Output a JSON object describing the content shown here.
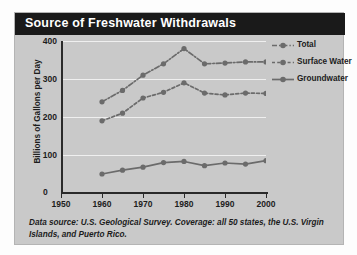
{
  "card": {
    "title": "Source of Freshwater Withdrawals",
    "footnote": "Data source: U.S. Geological Survey. Coverage: all 50 states, the U.S. Virgin Islands, and Puerto Rico."
  },
  "colors": {
    "title_bar": "#1a1a1a",
    "title_text": "#ffffff",
    "card_bg": "#c9c9c9",
    "series": "#6b6b6b",
    "gridline": "#efefef",
    "axis": "#2a2a2a"
  },
  "chart_data": {
    "type": "line",
    "title": "Source of Freshwater Withdrawals",
    "xlabel": "",
    "ylabel": "Billions of Gallons per Day",
    "xlim": [
      1950,
      2000
    ],
    "ylim": [
      0,
      400
    ],
    "xticks": [
      1950,
      1960,
      1970,
      1980,
      1990,
      2000
    ],
    "yticks": [
      0,
      100,
      200,
      300,
      400
    ],
    "grid": true,
    "legend_position": "top-right",
    "x": [
      1960,
      1965,
      1970,
      1975,
      1980,
      1985,
      1990,
      1995,
      2000
    ],
    "series": [
      {
        "name": "Total",
        "style": "dash-dot",
        "values": [
          240,
          270,
          310,
          340,
          380,
          340,
          342,
          345,
          345
        ]
      },
      {
        "name": "Surface Water",
        "style": "dashed",
        "values": [
          190,
          210,
          250,
          265,
          290,
          263,
          258,
          263,
          262
        ]
      },
      {
        "name": "Groundwater",
        "style": "solid",
        "values": [
          50,
          60,
          68,
          80,
          83,
          72,
          79,
          76,
          85
        ]
      }
    ]
  },
  "legend": {
    "items": [
      {
        "label": "Total",
        "style": "dash-dot"
      },
      {
        "label": "Surface Water",
        "style": "dashed"
      },
      {
        "label": "Groundwater",
        "style": "solid"
      }
    ]
  }
}
